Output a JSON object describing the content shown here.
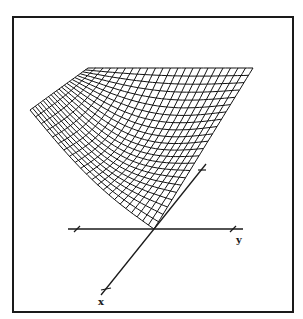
{
  "figure": {
    "frame": {
      "x": 13,
      "y": 17,
      "width": 280,
      "height": 295,
      "color": "#1a1a1a"
    },
    "line_color": "#111111",
    "axes": {
      "origin": [
        154,
        229
      ],
      "y_axis": {
        "label": "y",
        "from": [
          68,
          229
        ],
        "to": [
          243,
          229
        ],
        "ticks": [
          [
            77,
            229
          ],
          [
            233,
            229
          ]
        ],
        "label_pos": [
          236,
          243
        ]
      },
      "x_axis": {
        "label": "x",
        "from": [
          154,
          229
        ],
        "to": [
          101,
          295
        ],
        "ticks": [
          [
            106,
            289
          ]
        ],
        "label_pos": [
          98,
          305
        ]
      },
      "z_axis": {
        "label": "",
        "from": [
          154,
          229
        ],
        "to": [
          206,
          164
        ],
        "ticks": [
          [
            202,
            170
          ]
        ]
      }
    },
    "surface": {
      "type": "mesh",
      "grid_u": 22,
      "grid_v": 22,
      "top_left": [
        88,
        68
      ],
      "top_right": [
        253,
        68
      ],
      "left_tip": [
        30,
        110
      ],
      "bottom_vertex": [
        154,
        229
      ]
    }
  }
}
